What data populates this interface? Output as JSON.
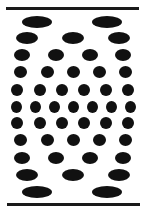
{
  "figure": {
    "colors": {
      "ink": "#111111",
      "line": "#1a1a1a",
      "background": "#ffffff"
    },
    "lines": [
      {
        "name": "top-line",
        "x1": 6,
        "x2": 139,
        "y": 7
      },
      {
        "name": "bottom-line",
        "x1": 7,
        "x2": 140,
        "y": 203
      }
    ],
    "rows": [
      {
        "y": 22,
        "w": 30,
        "h": 12,
        "xs": [
          37,
          107
        ]
      },
      {
        "y": 38,
        "w": 22,
        "h": 12,
        "xs": [
          27,
          73,
          119
        ]
      },
      {
        "y": 55,
        "w": 16,
        "h": 12,
        "xs": [
          22,
          56,
          90,
          123
        ]
      },
      {
        "y": 72,
        "w": 13,
        "h": 12,
        "xs": [
          20,
          47,
          73,
          99,
          125
        ]
      },
      {
        "y": 90,
        "w": 12,
        "h": 12,
        "xs": [
          17,
          40,
          62,
          84,
          106,
          128
        ]
      },
      {
        "y": 107,
        "w": 11,
        "h": 12,
        "xs": [
          16,
          35,
          54,
          73,
          92,
          111,
          130
        ]
      },
      {
        "y": 123,
        "w": 12,
        "h": 12,
        "xs": [
          17,
          40,
          62,
          84,
          106,
          128
        ]
      },
      {
        "y": 140,
        "w": 13,
        "h": 12,
        "xs": [
          20,
          47,
          73,
          99,
          125
        ]
      },
      {
        "y": 158,
        "w": 16,
        "h": 12,
        "xs": [
          22,
          56,
          90,
          123
        ]
      },
      {
        "y": 175,
        "w": 22,
        "h": 12,
        "xs": [
          27,
          73,
          119
        ]
      },
      {
        "y": 192,
        "w": 30,
        "h": 12,
        "xs": [
          37,
          107
        ]
      }
    ]
  }
}
